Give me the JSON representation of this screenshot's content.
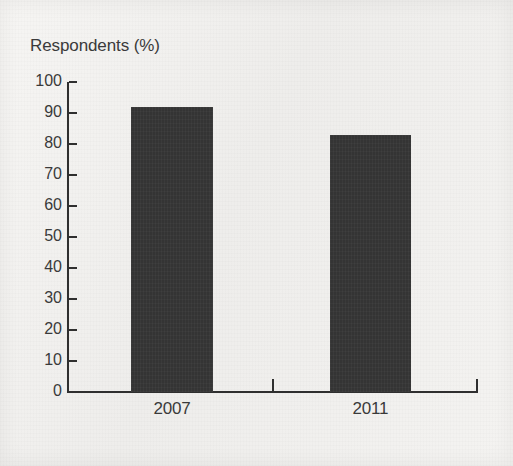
{
  "figure": {
    "background_color": "#f1f0ee",
    "bar_color": "#343434",
    "axis_color": "#2f2f2f",
    "text_color": "#3a3a3a"
  },
  "chart_data": {
    "type": "bar",
    "title": "",
    "subtitle": "",
    "xlabel": "",
    "ylabel": "Respondents (%)",
    "categories": [
      "2007",
      "2011"
    ],
    "values": [
      92,
      83
    ],
    "series": [
      {
        "name": "Respondents",
        "values": [
          92,
          83
        ]
      }
    ],
    "ylim": [
      0,
      100
    ],
    "y_ticks": [
      0,
      10,
      20,
      30,
      40,
      50,
      60,
      70,
      80,
      90,
      100
    ],
    "y_tick_labels": [
      "0",
      "10",
      "20",
      "30",
      "40",
      "50",
      "60",
      "70",
      "80",
      "90",
      "100"
    ],
    "x_tick_labels": [
      "2007",
      "2011"
    ],
    "grid": false,
    "legend": false,
    "legend_position": "none",
    "annotations": [],
    "data_labels_shown": false
  }
}
